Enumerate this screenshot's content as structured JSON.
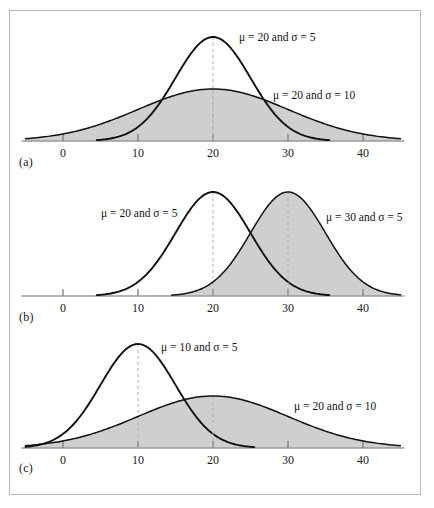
{
  "figure": {
    "panels": [
      {
        "letter": "(a)",
        "axis_ticks": [
          "0",
          "10",
          "20",
          "30",
          "40"
        ],
        "tick_values": [
          0,
          10,
          20,
          30,
          40
        ],
        "curves": [
          {
            "label": "μ = 20 and σ = 5",
            "mu": 20,
            "sigma": 5,
            "filled": false,
            "label_x": 238,
            "label_y": 40
          },
          {
            "label": "μ = 20 and σ = 10",
            "mu": 20,
            "sigma": 10,
            "filled": true,
            "label_x": 272,
            "label_y": 98
          }
        ]
      },
      {
        "letter": "(b)",
        "axis_ticks": [
          "0",
          "10",
          "20",
          "30",
          "40"
        ],
        "tick_values": [
          0,
          10,
          20,
          30,
          40
        ],
        "curves": [
          {
            "label": "μ = 20 and σ = 5",
            "mu": 20,
            "sigma": 5,
            "filled": false,
            "label_x": 100,
            "label_y": 216
          },
          {
            "label": "μ = 30 and σ = 5",
            "mu": 30,
            "sigma": 5,
            "filled": true,
            "label_x": 325,
            "label_y": 220
          }
        ]
      },
      {
        "letter": "(c)",
        "axis_ticks": [
          "0",
          "10",
          "20",
          "30",
          "40"
        ],
        "tick_values": [
          0,
          10,
          20,
          30,
          40
        ],
        "curves": [
          {
            "label": "μ = 10 and σ = 5",
            "mu": 10,
            "sigma": 5,
            "filled": false,
            "label_x": 160,
            "label_y": 350
          },
          {
            "label": "μ = 20 and σ = 10",
            "mu": 20,
            "sigma": 10,
            "filled": true,
            "label_x": 293,
            "label_y": 409
          }
        ]
      }
    ]
  },
  "chart_data": {
    "type": "line",
    "title": "",
    "xlabel": "",
    "ylabel": "",
    "xlim": [
      -5,
      45
    ],
    "xticks": [
      0,
      10,
      20,
      30,
      40
    ],
    "grid": false,
    "legend": "inline-annotations",
    "panels": [
      {
        "id": "a",
        "letter": "(a)",
        "series": [
          {
            "name": "μ = 20 and σ = 5",
            "mu": 20,
            "sigma": 5,
            "shaded": false,
            "peak_density": 0.0798
          },
          {
            "name": "μ = 20 and σ = 10",
            "mu": 20,
            "sigma": 10,
            "shaded": true,
            "peak_density": 0.0399
          }
        ],
        "note": "Same mean, different standard deviations"
      },
      {
        "id": "b",
        "letter": "(b)",
        "series": [
          {
            "name": "μ = 20 and σ = 5",
            "mu": 20,
            "sigma": 5,
            "shaded": false,
            "peak_density": 0.0798
          },
          {
            "name": "μ = 30 and σ = 5",
            "mu": 30,
            "sigma": 5,
            "shaded": true,
            "peak_density": 0.0798
          }
        ],
        "note": "Different means, same standard deviation"
      },
      {
        "id": "c",
        "letter": "(c)",
        "series": [
          {
            "name": "μ = 10 and σ = 5",
            "mu": 10,
            "sigma": 5,
            "shaded": false,
            "peak_density": 0.0798
          },
          {
            "name": "μ = 20 and σ = 10",
            "mu": 20,
            "sigma": 10,
            "shaded": true,
            "peak_density": 0.0399
          }
        ],
        "note": "Different means, different standard deviations"
      }
    ],
    "colors": {
      "curve_stroke": "#111111",
      "fill": "#cfcfcf",
      "axis": "#9a9a9a",
      "mean_line": "#b0b0b0",
      "frame": "#b9b9b9"
    }
  }
}
